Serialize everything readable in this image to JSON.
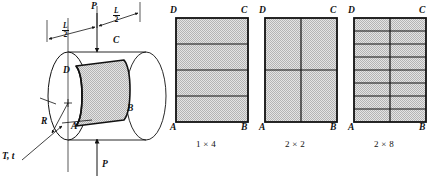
{
  "figure": {
    "background_color": "#ffffff",
    "line_color": "#111111",
    "shell_fill_color": "#d8d8d8",
    "mesh_fill_color": "#d8d8d8",
    "stipple_color": "#9c9c9c"
  },
  "cylinder": {
    "name": "pinched-cylindrical-shell",
    "corner_labels": {
      "a": "A",
      "b": "B",
      "c": "C",
      "d": "D"
    },
    "load_top": "P",
    "load_bottom": "P",
    "radius_label": "R",
    "thickness_label": "T, t",
    "dim_left": {
      "numerator": "L",
      "denominator": "2"
    },
    "dim_right": {
      "numerator": "L",
      "denominator": "2"
    },
    "bottom_caption": ""
  },
  "meshes": [
    {
      "name": "mesh-1x4",
      "caption": "1 × 4",
      "columns": 1,
      "rows": 4,
      "corner_labels": {
        "a": "A",
        "b": "B",
        "c": "C",
        "d": "D"
      }
    },
    {
      "name": "mesh-2x2",
      "caption": "2 × 2",
      "columns": 2,
      "rows": 2,
      "corner_labels": {
        "a": "A",
        "b": "B",
        "c": "C",
        "d": "D"
      }
    },
    {
      "name": "mesh-2x8",
      "caption": "2 × 8",
      "columns": 2,
      "rows": 8,
      "corner_labels": {
        "a": "A",
        "b": "B",
        "c": "C",
        "d": "D"
      }
    }
  ]
}
